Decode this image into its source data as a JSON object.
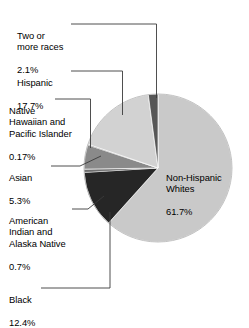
{
  "chart_data": {
    "type": "pie",
    "title": "",
    "subtitle": "",
    "xlabel": "",
    "ylabel": "",
    "legend_position": "none",
    "grid": false,
    "units": "percent",
    "categories": [
      "Non-Hispanic Whites",
      "Black",
      "American Indian and Alaska Native",
      "Asian",
      "Native Hawaiian and Pacific Islander",
      "Hispanic",
      "Two or more races"
    ],
    "values": [
      61.7,
      12.4,
      0.7,
      5.3,
      0.17,
      17.7,
      2.1
    ],
    "colors": [
      "#c9c9c9",
      "#262626",
      "#6e6e6e",
      "#8a8a8a",
      "#5a5a5a",
      "#d2d2d2",
      "#575757"
    ],
    "slices": [
      {
        "name": "non-hispanic-whites",
        "label": "Non-Hispanic\nWhites",
        "value_label": "61.7%",
        "value": 61.7,
        "color": "#c9c9c9",
        "label_placement": "inside"
      },
      {
        "name": "black",
        "label": "Black",
        "value_label": "12.4%",
        "value": 12.4,
        "color": "#262626",
        "label_placement": "callout"
      },
      {
        "name": "american-indian-and-alaska-native",
        "label": "American\nIndian and\nAlaska Native",
        "value_label": "0.7%",
        "value": 0.7,
        "color": "#6e6e6e",
        "label_placement": "callout"
      },
      {
        "name": "asian",
        "label": "Asian",
        "value_label": "5.3%",
        "value": 5.3,
        "color": "#8a8a8a",
        "label_placement": "callout"
      },
      {
        "name": "native-hawaiian-and-pacific-islander",
        "label": "Native\nHawaiian and\nPacific Islander",
        "value_label": "0.17%",
        "value": 0.17,
        "color": "#5a5a5a",
        "label_placement": "callout"
      },
      {
        "name": "hispanic",
        "label": "Hispanic",
        "value_label": "17.7%",
        "value": 17.7,
        "color": "#d2d2d2",
        "label_placement": "callout"
      },
      {
        "name": "two-or-more-races",
        "label": "Two or\nmore races",
        "value_label": "2.1%",
        "value": 2.1,
        "color": "#575757",
        "label_placement": "callout"
      }
    ]
  },
  "labels": {
    "two_or_more_races": {
      "name": "Two or\nmore races",
      "value": "2.1%"
    },
    "hispanic": {
      "name": "Hispanic",
      "value": "17.7%"
    },
    "native_hawaiian": {
      "name": "Native\nHawaiian and\nPacific Islander",
      "value": "0.17%"
    },
    "asian": {
      "name": "Asian",
      "value": "5.3%"
    },
    "american_indian": {
      "name": "American\nIndian and\nAlaska Native",
      "value": "0.7%"
    },
    "black": {
      "name": "Black",
      "value": "12.4%"
    },
    "non_hispanic_whites": {
      "name": "Non-Hispanic\nWhites",
      "value": "61.7%"
    }
  }
}
